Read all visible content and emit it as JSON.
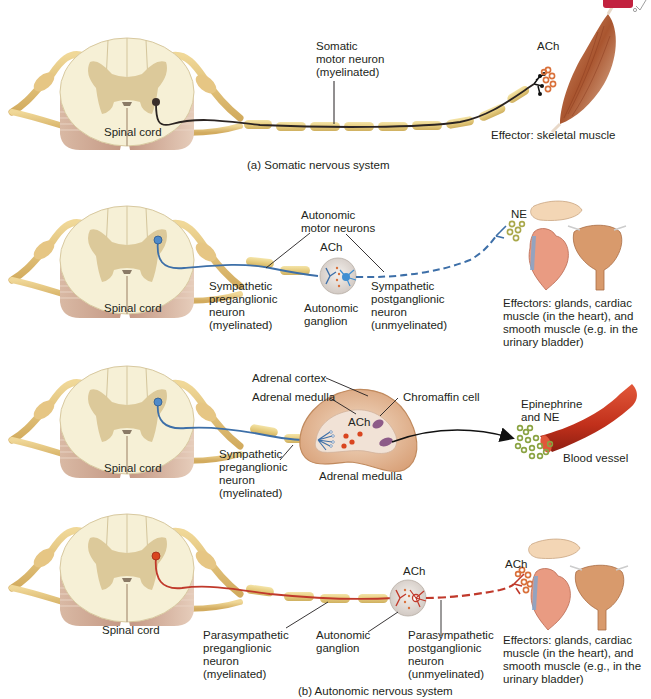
{
  "figure": {
    "panel_a": {
      "caption": "(a) Somatic nervous system",
      "spinal_cord_label": "Spinal cord",
      "neuron_label": "Somatic\nmotor neuron\n(myelinated)",
      "neurotransmitter": "ACh",
      "effector_label": "Effector: skeletal muscle",
      "neuron_color": "#2b2422"
    },
    "panel_b1": {
      "spinal_cord_label": "Spinal cord",
      "autonomic_motor_label": "Autonomic\nmotor neurons",
      "ganglion_neurotransmitter": "ACh",
      "preganglionic_label": "Sympathetic\npreganglionic\nneuron\n(myelinated)",
      "ganglion_label": "Autonomic\nganglion",
      "postganglionic_label": "Sympathetic\npostganglionic\nneuron\n(unmyelinated)",
      "effector_neurotransmitter": "NE",
      "effector_label": "Effectors: glands, cardiac\nmuscle (in the heart), and\nsmooth muscle (e.g. in the\nurinary bladder)",
      "neuron_color": "#3d6fa8"
    },
    "panel_b2": {
      "spinal_cord_label": "Spinal cord",
      "adrenal_cortex_label": "Adrenal cortex",
      "adrenal_medulla_inner_label": "Adrenal medulla",
      "chromaffin_label": "Chromaffin cell",
      "neurotransmitter": "ACh",
      "preganglionic_label": "Sympathetic\npreganglionic\nneuron\n(myelinated)",
      "gland_label": "Adrenal medulla",
      "hormone_label": "Epinephrine\nand NE",
      "vessel_label": "Blood vessel",
      "neuron_color": "#3d6fa8"
    },
    "panel_b3": {
      "spinal_cord_label": "Spinal cord",
      "ganglion_neurotransmitter": "ACh",
      "preganglionic_label": "Parasympathetic\npreganglionic\nneuron\n(myelinated)",
      "ganglion_label": "Autonomic\nganglion",
      "postganglionic_label": "Parasympathetic\npostganglionic\nneuron\n(unmyelinated)",
      "effector_neurotransmitter": "ACh",
      "effector_label": "Effectors: glands, cardiac\nmuscle (in the heart), and\nsmooth muscle (e.g., in the\nurinary bladder)",
      "neuron_color": "#c0392b"
    },
    "caption_b": "(b) Autonomic nervous system",
    "colors": {
      "myelin": "#e9d38e",
      "cord_white": "#f6f0d6",
      "cord_gray": "#dcc99a",
      "nerve": "#e4c47c",
      "muscle": "#b5653e",
      "vessel": "#c9361f",
      "ne_vesicle": "#a9a84a",
      "ach_vesicle": "#d9703a"
    }
  }
}
